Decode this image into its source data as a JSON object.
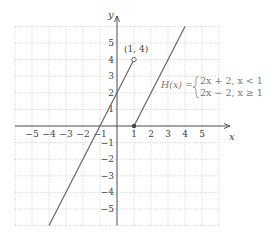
{
  "chart_data": {
    "type": "line",
    "title": "",
    "xlabel": "x",
    "ylabel": "y",
    "xlim": [
      -6,
      6
    ],
    "ylim": [
      -6,
      6
    ],
    "grid": true,
    "x_ticks": [
      "−5",
      "−4",
      "−3",
      "−2",
      "−1",
      "1",
      "2",
      "3",
      "4",
      "5"
    ],
    "y_ticks": [
      "5",
      "4",
      "3",
      "2",
      "1",
      "−1",
      "−2",
      "−3",
      "−4",
      "−5"
    ],
    "series": [
      {
        "name": "2x + 2, x < 1",
        "x": [
          -4,
          1
        ],
        "y": [
          -6,
          4
        ],
        "end_marker": "open"
      },
      {
        "name": "2x − 2, x ≥ 1",
        "x": [
          1,
          4
        ],
        "y": [
          0,
          6
        ],
        "start_marker": "closed"
      }
    ],
    "annotations": [
      {
        "text": "(1, 4)",
        "x": 1,
        "y": 4
      },
      {
        "text": "H(x) =",
        "line1": "2x + 2, x < 1",
        "line2": "2x − 2, x ≥ 1"
      }
    ]
  },
  "labels": {
    "x_axis": "x",
    "y_axis": "y",
    "point": "(1, 4)",
    "fn": "H(x) =",
    "piece1": "2x + 2, x < 1",
    "piece2": "2x − 2, x ≥ 1"
  }
}
